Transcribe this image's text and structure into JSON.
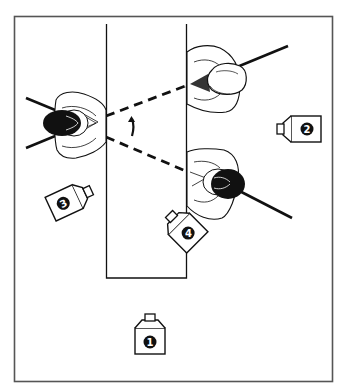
{
  "diagram": {
    "type": "camera-blocking-floor-plan",
    "colors": {
      "line": "#111111",
      "background": "#ffffff",
      "frame": "#555555",
      "hair": "#111111"
    },
    "cameras": [
      {
        "id": 1,
        "label": "1",
        "x": 150,
        "y": 333,
        "rotation": 0
      },
      {
        "id": 2,
        "label": "2",
        "x": 303,
        "y": 129,
        "rotation": -90
      },
      {
        "id": 3,
        "label": "3",
        "x": 68,
        "y": 200,
        "rotation": 60
      },
      {
        "id": 4,
        "label": "4",
        "x": 184,
        "y": 230,
        "rotation": -45
      }
    ],
    "actors": [
      {
        "id": "left-actor",
        "hair": "dark",
        "facing": "right"
      },
      {
        "id": "right-top-actor",
        "hair": "light",
        "facing": "left",
        "note": "back-of-head"
      },
      {
        "id": "right-bottom-actor",
        "hair": "dark",
        "facing": "left"
      }
    ],
    "sightlines": [
      {
        "from": "left-actor",
        "to": "right-top-actor",
        "style": "dashed"
      },
      {
        "from": "left-actor",
        "to": "right-bottom-actor",
        "style": "dashed"
      }
    ],
    "head_turn_arrow": {
      "direction": "up"
    }
  }
}
